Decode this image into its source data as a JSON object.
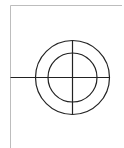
{
  "diagram": {
    "type": "crosshair-target",
    "colors": {
      "background": "#ffffff",
      "frame": "#bdbdbd",
      "stroke": "#222222"
    },
    "frame": {
      "left_x": 10.5,
      "top_y": 5.5,
      "right_x": 122,
      "bottom_y": 148
    },
    "center": {
      "x": 72.5,
      "y": 77.5
    },
    "outer_circle": {
      "r": 37
    },
    "inner_circle": {
      "r": 24.5
    },
    "horizontal_line": {
      "x1": 10.5,
      "x2": 109.5
    },
    "vertical_line": {
      "y1": 40.5,
      "y2": 114.5
    }
  }
}
